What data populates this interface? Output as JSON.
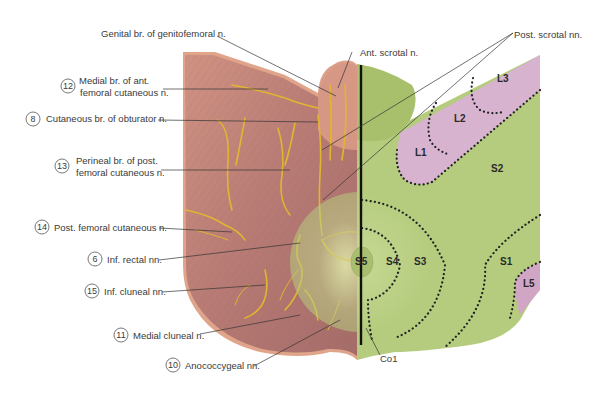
{
  "figure": {
    "type": "anatomical-diagram",
    "left_half": "cutaneous nerves",
    "right_half": "dermatomes"
  },
  "labels_left": [
    {
      "number": "",
      "text": "Genital br. of genitofemoral n."
    },
    {
      "number": "12",
      "text_line1": "Medial br. of ant.",
      "text_line2": "femoral cutaneous n."
    },
    {
      "number": "8",
      "text": "Cutaneous br. of obturator n."
    },
    {
      "number": "13",
      "text_line1": "Perineal br. of post.",
      "text_line2": "femoral cutaneous n."
    },
    {
      "number": "14",
      "text": "Post. femoral cutaneous n."
    },
    {
      "number": "6",
      "text": "Inf. rectal nn."
    },
    {
      "number": "15",
      "text": "Inf. cluneal nn."
    },
    {
      "number": "11",
      "text": "Medial cluneal n."
    },
    {
      "number": "10",
      "text": "Anococcygeal nn."
    }
  ],
  "labels_top": {
    "ant_scrotal": "Ant. scrotal n.",
    "post_scrotal": "Post. scrotal nn."
  },
  "labels_bottom": {
    "co1": "Co1"
  },
  "dermatomes": [
    "L1",
    "L2",
    "L3",
    "S2",
    "S5",
    "S4",
    "S3",
    "S1",
    "L5"
  ],
  "colors": {
    "skin": "#c98b7c",
    "skin_dark": "#a86a63",
    "skin_edge": "#e2a88e",
    "nerve": "#e2b530",
    "dermatome_green": "#b5cc7e",
    "dermatome_pink": "#d7b3cf",
    "coccygeal_orange": "#d9803e",
    "midline": "#111111"
  }
}
